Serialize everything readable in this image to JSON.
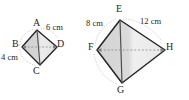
{
  "image": {
    "kind": "geometry-diagram",
    "description": "Two similar kite quadrilaterals with labeled side measurements",
    "background_color": "#ffffff",
    "width": 189,
    "height": 100
  },
  "style": {
    "outline_color": "#262626",
    "fill_color": "#d9d9d9",
    "fill_color_light": "#e6e6e6",
    "diagonal_color": "#8c8c8c",
    "arc_color": "#a6a6a6",
    "text_color": "#262626"
  },
  "figures": [
    {
      "id": "small-kite",
      "name": "kite-abcd",
      "vertices": [
        {
          "label": "A",
          "x": 37,
          "y": 30
        },
        {
          "label": "B",
          "x": 22,
          "y": 47
        },
        {
          "label": "C",
          "x": 40,
          "y": 65
        },
        {
          "label": "D",
          "x": 57,
          "y": 47
        }
      ],
      "measurements": [
        {
          "label": "6 cm",
          "side": "A-D"
        },
        {
          "label": "4 cm",
          "side": "B-C"
        }
      ]
    },
    {
      "id": "large-kite",
      "name": "kite-efgh",
      "vertices": [
        {
          "label": "E",
          "x": 120,
          "y": 20
        },
        {
          "label": "F",
          "x": 97,
          "y": 50
        },
        {
          "label": "G",
          "x": 122,
          "y": 83
        },
        {
          "label": "H",
          "x": 165,
          "y": 50
        }
      ],
      "measurements": [
        {
          "label": "8 cm",
          "side": "E-F"
        },
        {
          "label": "12 cm",
          "side": "E-H"
        }
      ]
    }
  ]
}
